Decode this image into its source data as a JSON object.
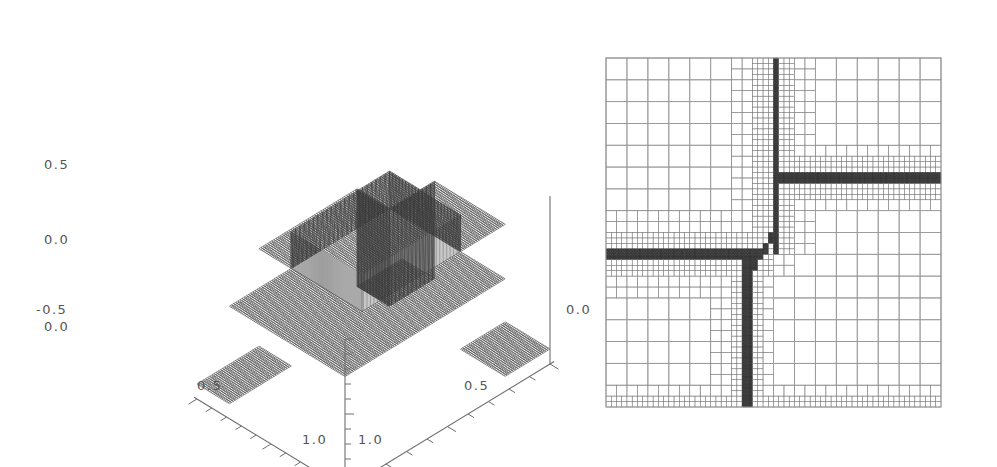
{
  "figure": {
    "background": "#ffffff",
    "ink": "#4a4a4a",
    "panel_count": 2
  },
  "chart_data": [
    {
      "type": "surface",
      "panel": "left",
      "title": "",
      "subtitle": "",
      "description": "3D wireframe surface plot of a piecewise-constant (step) function on the unit square, viewed in isometric projection. A raised square plateau occupies the central/back region, two mid-level wings extend to the left and right, and a lower base level occupies the front. Near-vertical mesh walls with dense zigzag lines mark the discontinuities.",
      "xlabel": "",
      "ylabel": "",
      "zlabel": "",
      "xlim": [
        0.0,
        1.0
      ],
      "ylim": [
        0.0,
        1.0
      ],
      "zlim": [
        -0.5,
        0.5
      ],
      "x_ticklabels": [
        "0.0",
        "0.5",
        "1.0"
      ],
      "y_ticklabels": [
        "0.0",
        "0.5",
        "1.0"
      ],
      "z_ticklabels": [
        "0.5",
        "0.0",
        "-0.5"
      ],
      "z_major_ticks": [
        0.5,
        0.0,
        -0.5
      ],
      "z_minor_tick_step": 0.1,
      "axis_tick_step": 0.1,
      "grid": false,
      "legend": null,
      "levels": [
        {
          "name": "upper-plateau",
          "value": 0.5
        },
        {
          "name": "mid-wing-left",
          "value": 0.25
        },
        {
          "name": "mid-wing-right",
          "value": 0.25
        },
        {
          "name": "lower-base",
          "value": -0.4
        }
      ],
      "origin_label": "0.0",
      "right_axis_label": "0.0",
      "mesh_color": "#3a3a3a",
      "axis_color": "#6e6e6e"
    },
    {
      "type": "heatmap",
      "panel": "right",
      "title": "",
      "description": "Adaptive mesh refinement (AMR) grid over the unit square. Cells are coarse in smooth regions and recursively subdivided toward the discontinuity fronts, which appear as solid black bands where the finest cells saturate. A cross-shaped pattern of refined bands runs vertically and horizontally, joined by a staircase diagonal near the centre.",
      "xlabel": "",
      "ylabel": "",
      "xlim": [
        0.0,
        1.0
      ],
      "ylim": [
        0.0,
        1.0
      ],
      "grid": true,
      "legend": null,
      "refinement_levels": [
        {
          "level": 0,
          "name": "coarse",
          "cell_px": 21.0,
          "line_color": "#9a9a9a"
        },
        {
          "level": 1,
          "name": "medium",
          "cell_px": 10.5,
          "line_color": "#8a8a8a"
        },
        {
          "level": 2,
          "name": "fine",
          "cell_px": 5.25,
          "line_color": "#7a7a7a"
        },
        {
          "level": 3,
          "name": "saturated",
          "cell_px": 2.62,
          "line_color": "#333333"
        }
      ],
      "base_cells_x": 16,
      "base_cells_y": 16,
      "border_color": "#8f8f8f"
    }
  ],
  "left_panel": {
    "name": "surface-plot",
    "ticklabels": {
      "z_top": "0.5",
      "z_mid": "0.0",
      "z_bottom": "-0.5",
      "x_origin": "0.0",
      "x_mid": "0.5",
      "x_end": "1.0",
      "y_mid": "0.5",
      "y_end": "1.0",
      "y_origin": "0.0"
    }
  },
  "right_panel": {
    "name": "amr-mesh-plot"
  }
}
